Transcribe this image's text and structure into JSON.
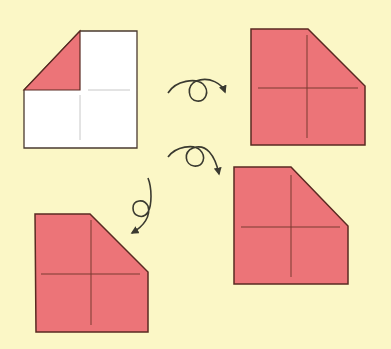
{
  "diagram": {
    "title": "",
    "type": "origami-folding-steps",
    "colors": {
      "background": "#fbf7c6",
      "paper_colored": "#ec7478",
      "paper_white": "#ffffff",
      "outline": "#5a2a22",
      "crease": "#7a3a30",
      "white_crease": "#c8c8c8",
      "arrow": "#3a3a30"
    },
    "steps": [
      {
        "id": 1,
        "label": "",
        "description": "White square with top-left corner folded showing colored triangle"
      },
      {
        "id": 2,
        "label": "",
        "description": "Turned over: colored side up with cut corner top-right"
      },
      {
        "id": 3,
        "label": "",
        "description": "Rotated/turned: colored square with cut corner top-right"
      },
      {
        "id": 4,
        "label": "",
        "description": "Turned: colored square with cut corner top-right"
      }
    ],
    "arrows": [
      {
        "id": 1,
        "icon": "turn-over-arrow-icon",
        "from_step": 1,
        "to_step": 2
      },
      {
        "id": 2,
        "icon": "turn-over-arrow-icon",
        "from_step": 1,
        "to_step": 3
      },
      {
        "id": 3,
        "icon": "turn-over-arrow-icon",
        "from_step": 1,
        "to_step": 4
      }
    ]
  }
}
